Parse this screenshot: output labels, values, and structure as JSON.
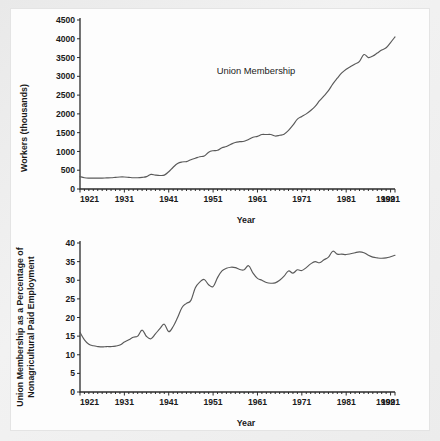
{
  "page": {
    "background_color": "#ededed",
    "panel_color": "#fdfdfd"
  },
  "chart_data": [
    {
      "id": "union-membership-absolute",
      "type": "line",
      "title": "",
      "annotation": "Union Membership",
      "xlabel": "Year",
      "ylabel": "Workers (thousands)",
      "xlim": [
        1921,
        1992
      ],
      "ylim": [
        0,
        4500
      ],
      "grid": false,
      "legend": null,
      "line_color": "#5a5a5a",
      "yticks": [
        0,
        500,
        1000,
        1500,
        2000,
        2500,
        3000,
        3500,
        4000,
        4500
      ],
      "ytick_labels": [
        "0",
        "500",
        "1000",
        "1500",
        "2000",
        "2500",
        "3000",
        "3500",
        "4000",
        "4500"
      ],
      "xticks": [
        1921,
        1931,
        1941,
        1951,
        1961,
        1971,
        1981,
        1991,
        1992
      ],
      "xtick_labels": [
        "1921",
        "1931",
        "1941",
        "1951",
        "1961",
        "1971",
        "1981",
        "1991",
        "1992"
      ],
      "x": [
        1921,
        1922,
        1923,
        1924,
        1925,
        1926,
        1927,
        1928,
        1929,
        1930,
        1931,
        1932,
        1933,
        1934,
        1935,
        1936,
        1937,
        1938,
        1939,
        1940,
        1941,
        1942,
        1943,
        1944,
        1945,
        1946,
        1947,
        1948,
        1949,
        1950,
        1951,
        1952,
        1953,
        1954,
        1955,
        1956,
        1957,
        1958,
        1959,
        1960,
        1961,
        1962,
        1963,
        1964,
        1965,
        1966,
        1967,
        1968,
        1969,
        1970,
        1971,
        1972,
        1973,
        1974,
        1975,
        1976,
        1977,
        1978,
        1979,
        1980,
        1981,
        1982,
        1983,
        1984,
        1985,
        1986,
        1987,
        1988,
        1989,
        1990,
        1991,
        1992
      ],
      "y": [
        330,
        300,
        290,
        290,
        290,
        290,
        295,
        300,
        310,
        320,
        320,
        310,
        300,
        300,
        310,
        330,
        390,
        370,
        360,
        370,
        460,
        580,
        680,
        720,
        730,
        780,
        820,
        860,
        880,
        980,
        1020,
        1030,
        1100,
        1130,
        1190,
        1240,
        1260,
        1270,
        1320,
        1380,
        1400,
        1450,
        1450,
        1450,
        1410,
        1430,
        1460,
        1560,
        1700,
        1860,
        1930,
        2000,
        2090,
        2200,
        2350,
        2480,
        2620,
        2800,
        2950,
        3090,
        3190,
        3260,
        3330,
        3400,
        3580,
        3500,
        3540,
        3620,
        3700,
        3760,
        3900,
        4050
      ]
    },
    {
      "id": "union-membership-percentage",
      "type": "line",
      "title": "",
      "annotation": "",
      "xlabel": "Year",
      "ylabel": "Union Membership as a Percentage of Nonagricultural Paid Employment",
      "ylabel_line1": "Union Membership as a Percentage of",
      "ylabel_line2": "Nonagricultural Paid Employment",
      "xlim": [
        1921,
        1992
      ],
      "ylim": [
        0,
        40
      ],
      "grid": false,
      "legend": null,
      "line_color": "#5a5a5a",
      "yticks": [
        0,
        5,
        10,
        15,
        20,
        25,
        30,
        35,
        40
      ],
      "ytick_labels": [
        "0",
        "5",
        "10",
        "15",
        "20",
        "25",
        "30",
        "35",
        "40"
      ],
      "xticks": [
        1921,
        1931,
        1941,
        1951,
        1961,
        1971,
        1981,
        1991,
        1992
      ],
      "xtick_labels": [
        "1921",
        "1931",
        "1941",
        "1951",
        "1961",
        "1971",
        "1981",
        "1991",
        "1992"
      ],
      "x": [
        1921,
        1922,
        1923,
        1924,
        1925,
        1926,
        1927,
        1928,
        1929,
        1930,
        1931,
        1932,
        1933,
        1934,
        1935,
        1936,
        1937,
        1938,
        1939,
        1940,
        1941,
        1942,
        1943,
        1944,
        1945,
        1946,
        1947,
        1948,
        1949,
        1950,
        1951,
        1952,
        1953,
        1954,
        1955,
        1956,
        1957,
        1958,
        1959,
        1960,
        1961,
        1962,
        1963,
        1964,
        1965,
        1966,
        1967,
        1968,
        1969,
        1970,
        1971,
        1972,
        1973,
        1974,
        1975,
        1976,
        1977,
        1978,
        1979,
        1980,
        1981,
        1982,
        1983,
        1984,
        1985,
        1986,
        1987,
        1988,
        1989,
        1990,
        1991,
        1992
      ],
      "y": [
        16.0,
        14.0,
        12.8,
        12.4,
        12.2,
        12.1,
        12.2,
        12.2,
        12.3,
        12.6,
        13.4,
        14.0,
        14.7,
        15.0,
        16.6,
        14.9,
        14.3,
        15.6,
        17.0,
        18.2,
        16.2,
        17.6,
        20.0,
        22.7,
        23.8,
        24.6,
        28.0,
        29.5,
        30.2,
        28.8,
        28.3,
        30.7,
        32.5,
        33.2,
        33.5,
        33.4,
        32.9,
        32.8,
        33.9,
        31.9,
        30.5,
        30.0,
        29.4,
        29.2,
        29.3,
        30.0,
        31.1,
        32.5,
        31.9,
        32.8,
        32.6,
        33.4,
        34.4,
        35.0,
        34.7,
        35.5,
        36.2,
        37.8,
        37.0,
        37.0,
        36.9,
        37.1,
        37.4,
        37.6,
        37.4,
        36.7,
        36.2,
        36.0,
        35.9,
        36.0,
        36.3,
        36.7
      ]
    }
  ]
}
